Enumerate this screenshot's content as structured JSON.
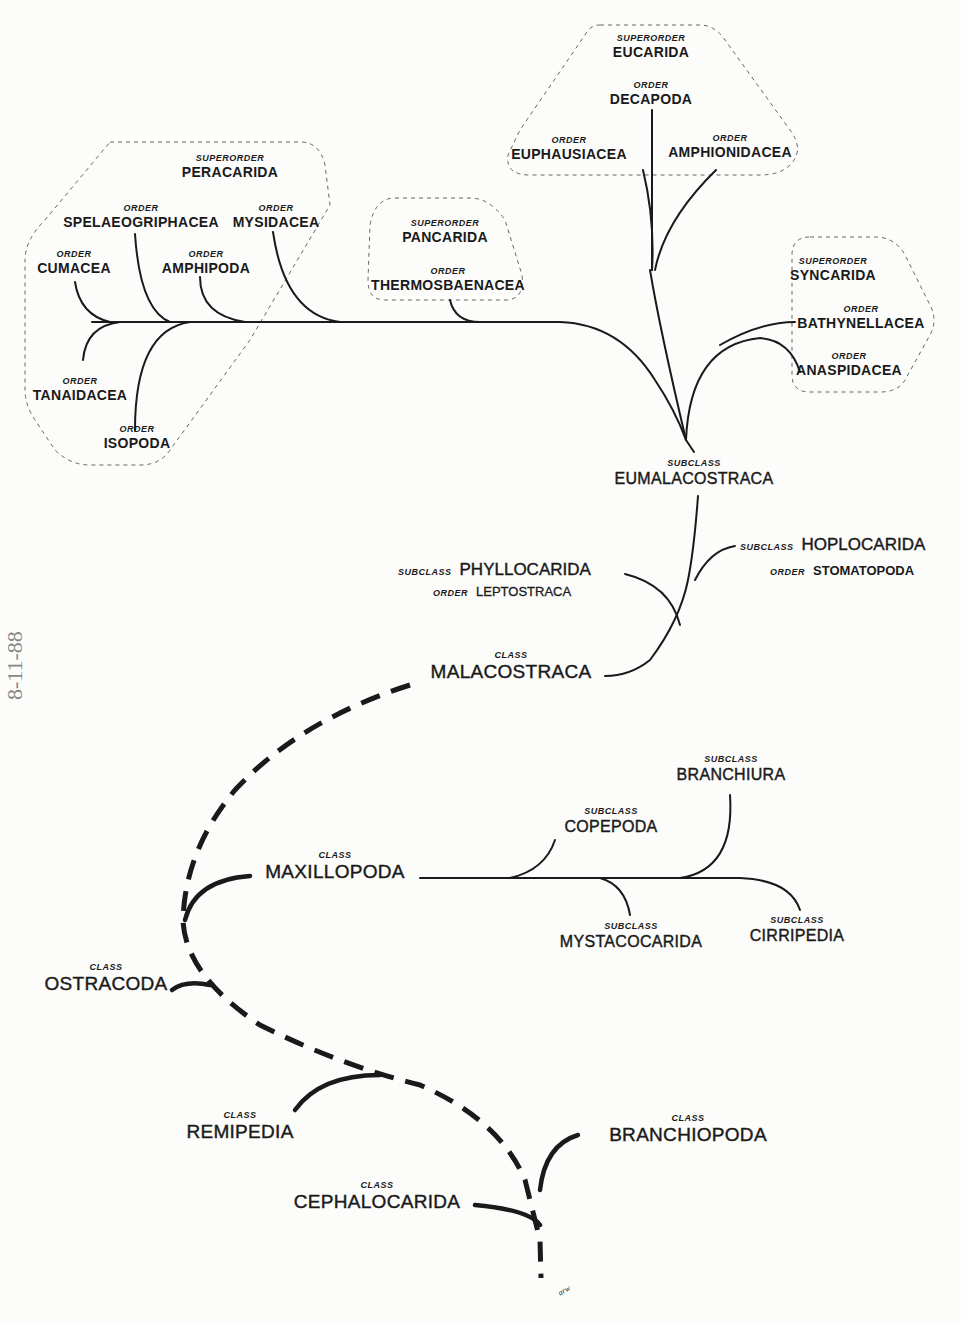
{
  "diagram": {
    "colors": {
      "ink": "#1a1a1a",
      "paper": "#fcfcfa",
      "boundary": "#666666"
    },
    "classes": {
      "malacostraca": {
        "rank": "CLASS",
        "name": "MALACOSTRACA"
      },
      "maxillopoda": {
        "rank": "CLASS",
        "name": "MAXILLOPODA"
      },
      "ostracoda": {
        "rank": "CLASS",
        "name": "OSTRACODA"
      },
      "remipedia": {
        "rank": "CLASS",
        "name": "REMIPEDIA"
      },
      "cephalocarida": {
        "rank": "CLASS",
        "name": "CEPHALOCARIDA"
      },
      "branchiopoda": {
        "rank": "CLASS",
        "name": "BRANCHIOPODA"
      }
    },
    "malacostraca_subclasses": {
      "eumalacostraca": {
        "rank": "SUBCLASS",
        "name": "EUMALACOSTRACA"
      },
      "phyllocarida": {
        "rank": "SUBCLASS",
        "name": "PHYLLOCARIDA",
        "order_rank": "ORDER",
        "order": "LEPTOSTRACA"
      },
      "hoplocarida": {
        "rank": "SUBCLASS",
        "name": "HOPLOCARIDA",
        "order_rank": "ORDER",
        "order": "STOMATOPODA"
      }
    },
    "maxillopoda_subclasses": {
      "copepoda": {
        "rank": "SUBCLASS",
        "name": "COPEPODA"
      },
      "branchiura": {
        "rank": "SUBCLASS",
        "name": "BRANCHIURA"
      },
      "mystacocarida": {
        "rank": "SUBCLASS",
        "name": "MYSTACOCARIDA"
      },
      "cirripedia": {
        "rank": "SUBCLASS",
        "name": "CIRRIPEDIA"
      }
    },
    "superorders": {
      "peracarida": {
        "rank": "SUPERORDER",
        "name": "PERACARIDA",
        "orders": [
          {
            "rank": "ORDER",
            "name": "SPELAEOGRIPHACEA"
          },
          {
            "rank": "ORDER",
            "name": "MYSIDACEA"
          },
          {
            "rank": "ORDER",
            "name": "CUMACEA"
          },
          {
            "rank": "ORDER",
            "name": "AMPHIPODA"
          },
          {
            "rank": "ORDER",
            "name": "TANAIDACEA"
          },
          {
            "rank": "ORDER",
            "name": "ISOPODA"
          }
        ]
      },
      "pancarida": {
        "rank": "SUPERORDER",
        "name": "PANCARIDA",
        "orders": [
          {
            "rank": "ORDER",
            "name": "THERMOSBAENACEA"
          }
        ]
      },
      "eucarida": {
        "rank": "SUPERORDER",
        "name": "EUCARIDA",
        "orders": [
          {
            "rank": "ORDER",
            "name": "DECAPODA"
          },
          {
            "rank": "ORDER",
            "name": "EUPHAUSIACEA"
          },
          {
            "rank": "ORDER",
            "name": "AMPHIONIDACEA"
          }
        ]
      },
      "syncarida": {
        "rank": "SUPERORDER",
        "name": "SYNCARIDA",
        "orders": [
          {
            "rank": "ORDER",
            "name": "BATHYNELLACEA"
          },
          {
            "rank": "ORDER",
            "name": "ANASPIDACEA"
          }
        ]
      }
    },
    "artist_initials": "arw",
    "margin_note": "8-11-88"
  }
}
